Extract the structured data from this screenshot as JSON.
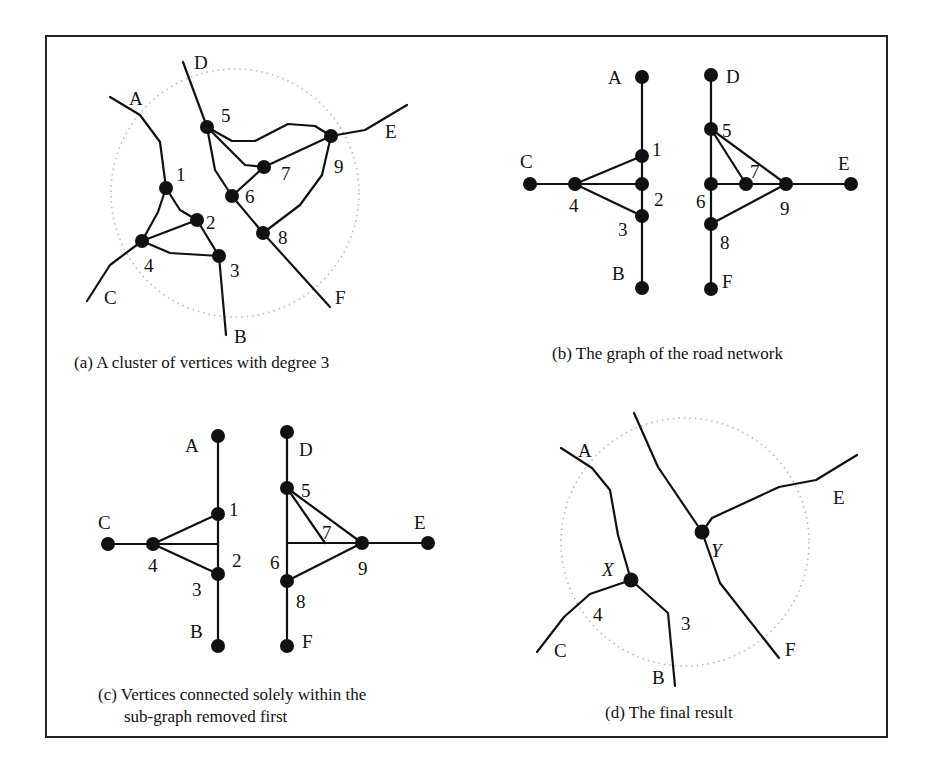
{
  "figure": {
    "panels": [
      {
        "id": "a",
        "caption": "(a)  A cluster of vertices with degree 3",
        "labels": {
          "A": "A",
          "B": "B",
          "C": "C",
          "D": "D",
          "E": "E",
          "F": "F",
          "n1": "1",
          "n2": "2",
          "n3": "3",
          "n4": "4",
          "n5": "5",
          "n6": "6",
          "n7": "7",
          "n8": "8",
          "n9": "9"
        }
      },
      {
        "id": "b",
        "caption": "(b)  The graph of the road network",
        "labels": {
          "A": "A",
          "B": "B",
          "C": "C",
          "D": "D",
          "E": "E",
          "F": "F",
          "n1": "1",
          "n2": "2",
          "n3": "3",
          "n4": "4",
          "n5": "5",
          "n6": "6",
          "n7": "7",
          "n8": "8",
          "n9": "9"
        }
      },
      {
        "id": "c",
        "caption_line1": "(c)  Vertices connected solely within the",
        "caption_line2": "sub-graph removed first",
        "labels": {
          "A": "A",
          "B": "B",
          "C": "C",
          "D": "D",
          "E": "E",
          "F": "F",
          "n1": "1",
          "n2": "2",
          "n3": "3",
          "n4": "4",
          "n5": "5",
          "n6": "6",
          "n7": "7",
          "n8": "8",
          "n9": "9"
        }
      },
      {
        "id": "d",
        "caption": "(d)  The final result",
        "labels": {
          "A": "A",
          "B": "B",
          "C": "C",
          "E": "E",
          "F": "F",
          "n3": "3",
          "n4": "4",
          "X": "X",
          "Y": "Y"
        }
      }
    ]
  }
}
